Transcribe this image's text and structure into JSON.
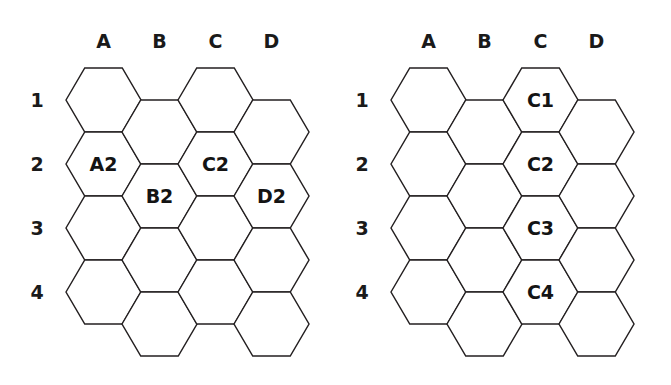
{
  "page": {
    "background_color": "#ffffff",
    "stroke_color": "#231f20",
    "text_color": "#1a1a1a",
    "width": 671,
    "height": 385
  },
  "figures": [
    {
      "id": "left-figure",
      "name": "hex-grid-left",
      "column_headers": [
        "A",
        "B",
        "C",
        "D"
      ],
      "row_headers": [
        "1",
        "2",
        "3",
        "4"
      ],
      "labeled_cells": [
        {
          "col": "A",
          "row": "2",
          "label": "A2"
        },
        {
          "col": "B",
          "row": "2",
          "label": "B2"
        },
        {
          "col": "C",
          "row": "2",
          "label": "C2"
        },
        {
          "col": "D",
          "row": "2",
          "label": "D2"
        }
      ]
    },
    {
      "id": "right-figure",
      "name": "hex-grid-right",
      "column_headers": [
        "A",
        "B",
        "C",
        "D"
      ],
      "row_headers": [
        "1",
        "2",
        "3",
        "4"
      ],
      "labeled_cells": [
        {
          "col": "C",
          "row": "1",
          "label": "C1"
        },
        {
          "col": "C",
          "row": "2",
          "label": "C2"
        },
        {
          "col": "C",
          "row": "3",
          "label": "C3"
        },
        {
          "col": "C",
          "row": "4",
          "label": "C4"
        }
      ]
    }
  ],
  "geometry": {
    "columns": 4,
    "rows": 4,
    "hex_orientation": "flat-top",
    "hex_width": 75,
    "hex_height": 64,
    "col_step": 56,
    "row_step": 64,
    "odd_column_drop": 32,
    "left_origin_x": 66,
    "left_origin_y": 68,
    "right_origin_x": 56,
    "right_origin_y": 68,
    "col_header_y": 42,
    "row_header_offset_x": -29
  }
}
